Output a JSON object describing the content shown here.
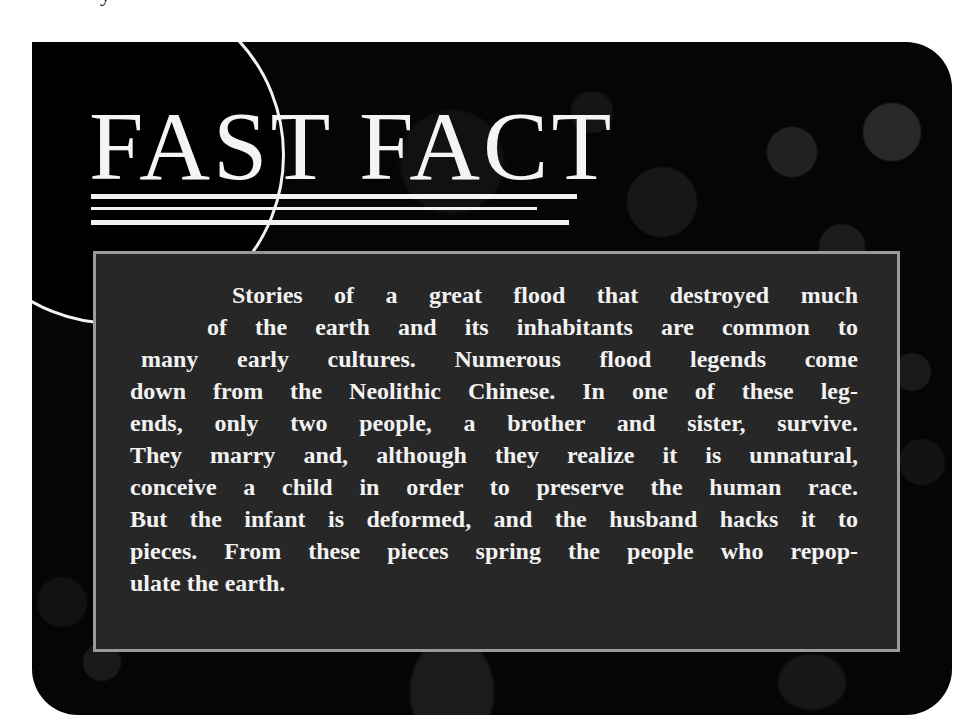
{
  "page": {
    "top_fragment": "y"
  },
  "card": {
    "title": "FAST FACT",
    "decorations": {
      "circle": "emblem-circle",
      "rules_count": 3
    },
    "body": {
      "lines": [
        "Stories of a great flood that destroyed much",
        "of the earth and its inhabitants are common to",
        "many early cultures. Numerous flood legends come",
        "down from the Neolithic Chinese. In one of these leg-",
        "ends, only two people, a brother and sister, survive.",
        "They marry and, although they realize it is unnatural,",
        "conceive a child in order to preserve the human race.",
        "But the infant is deformed, and the husband hacks it to",
        "pieces. From these pieces spring the people who repop-",
        "ulate the earth."
      ]
    }
  },
  "colors": {
    "card_background": "#050505",
    "panel_background": "#272727",
    "panel_border": "#9a9a9a",
    "text": "#f2f2f2"
  }
}
